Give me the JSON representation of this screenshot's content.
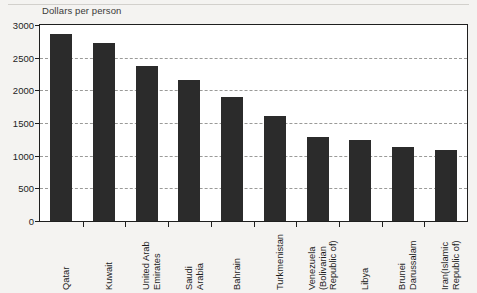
{
  "chart_data": {
    "type": "bar",
    "title": "",
    "axis_title": "Dollars per person",
    "xlabel": "",
    "ylabel": "Dollars per person",
    "ylim": [
      0,
      3000
    ],
    "ytick_values": [
      0,
      500,
      1000,
      1500,
      2000,
      2500,
      3000
    ],
    "ytick_labels": [
      "0",
      "500",
      "1000",
      "1500",
      "2000",
      "2500",
      "3000"
    ],
    "grid": true,
    "grid_axis": "y",
    "legend": "none",
    "bar_color": "#2b2b2b",
    "categories": [
      "Qatar",
      "Kuwait",
      "United Arab\nEmirates",
      "Saudi\nArabia",
      "Bahrain",
      "Turkmenistan",
      "Venezuela\n(Bolivarian\nRepublic of)",
      "Libya",
      "Brunei\nDarussalam",
      "Iran(Islamic\nRepublic of)"
    ],
    "values": [
      2870,
      2730,
      2380,
      2160,
      1900,
      1600,
      1280,
      1240,
      1140,
      1090
    ]
  }
}
